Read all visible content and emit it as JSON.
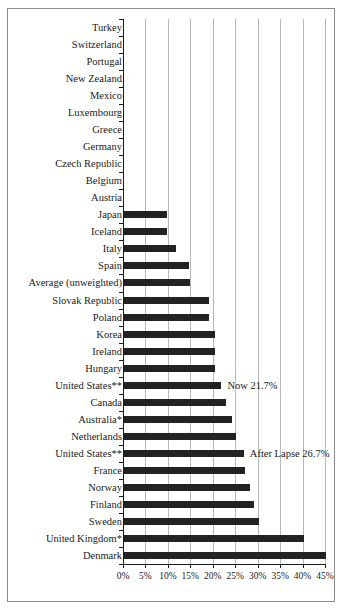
{
  "chart_data": {
    "type": "bar",
    "orientation": "horizontal",
    "title": "",
    "subtitle": "",
    "xlabel": "",
    "ylabel": "",
    "xlim": [
      0,
      45
    ],
    "xtick_labels": [
      "0%",
      "5%",
      "10%",
      "15%",
      "20%",
      "25%",
      "30%",
      "35%",
      "40%",
      "45%"
    ],
    "xtick_values": [
      0,
      5,
      10,
      15,
      20,
      25,
      30,
      35,
      40,
      45
    ],
    "grid": true,
    "legend": "none",
    "value_suffix": "%",
    "categories": [
      "Turkey",
      "Switzerland",
      "Portugal",
      "New Zealand",
      "Mexico",
      "Luxembourg",
      "Greece",
      "Germany",
      "Czech Republic",
      "Belgium",
      "Austria",
      "Japan",
      "Iceland",
      "Italy",
      "Spain",
      "Average (unweighted)",
      "Slovak Republic",
      "Poland",
      "Korea",
      "Ireland",
      "Hungary",
      "United States**",
      "Canada",
      "Australia*",
      "Netherlands",
      "United States**",
      "France",
      "Norway",
      "Finland",
      "Sweden",
      "United Kingdom*",
      "Denmark"
    ],
    "values": [
      0,
      0,
      0,
      0,
      0,
      0,
      0,
      0,
      0,
      0,
      0,
      9.5,
      9.5,
      11.5,
      14.5,
      14.8,
      19.0,
      19.0,
      20.3,
      20.3,
      20.3,
      21.7,
      22.8,
      24.0,
      25.0,
      26.7,
      27.0,
      28.0,
      29.0,
      30.0,
      40.0,
      45.0
    ],
    "annotations": [
      {
        "category": "United States**",
        "row_index": 21,
        "text": "Now 21.7%",
        "value": 21.7
      },
      {
        "category": "United States**",
        "row_index": 25,
        "text": "After Lapse 26.7%",
        "value": 26.7
      }
    ]
  },
  "colors": {
    "bar": "#222222",
    "gridline": "#b9b9b9",
    "axis": "#1a1a1a",
    "frame": "#8a8a8a",
    "background": "#ffffff",
    "text": "#1a1a1a"
  }
}
